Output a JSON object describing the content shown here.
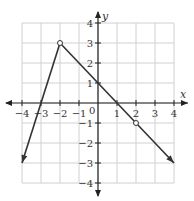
{
  "chart_data": {
    "type": "line",
    "title": "",
    "xlabel": "x",
    "ylabel": "y",
    "xlim": [
      -4,
      4
    ],
    "ylim": [
      -4,
      4
    ],
    "grid": true,
    "x_ticks": [
      -4,
      -3,
      -2,
      -1,
      1,
      2,
      3,
      4
    ],
    "y_ticks": [
      -4,
      -3,
      -2,
      -1,
      1,
      2,
      3,
      4
    ],
    "origin_label": "0",
    "series": [
      {
        "name": "left piece",
        "points": [
          [
            -4,
            -3
          ],
          [
            -2,
            3
          ]
        ],
        "equation": "y = 3x + 9",
        "start": "arrow",
        "end": "open-circle"
      },
      {
        "name": "right piece",
        "points": [
          [
            -2,
            3
          ],
          [
            4,
            -3
          ]
        ],
        "equation": "y = -x + 1",
        "start": "open-circle",
        "end": "arrow"
      }
    ],
    "open_points": [
      [
        -2,
        3
      ],
      [
        2,
        -1
      ]
    ],
    "annotations": []
  },
  "colors": {
    "grid": "#d0d0d0",
    "axis": "#222222",
    "curve": "#333333"
  }
}
